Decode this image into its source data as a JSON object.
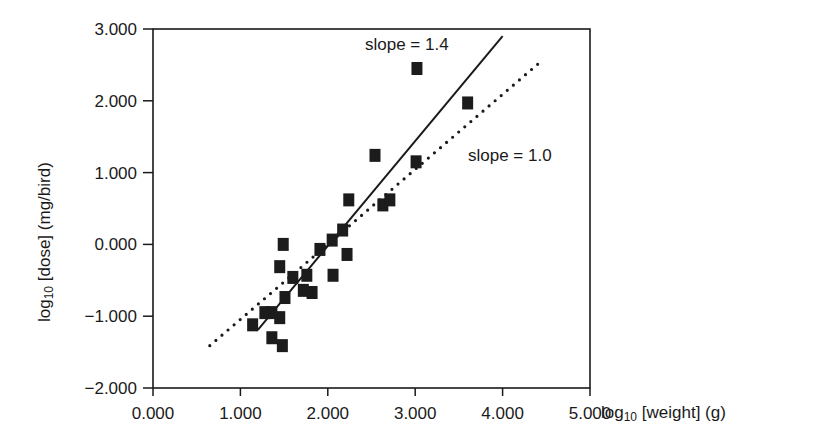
{
  "chart_data": {
    "type": "scatter",
    "title": "",
    "xlabel": "log10 [weight] (g)",
    "ylabel": "log10 [dose] (mg/bird)",
    "xlim": [
      0,
      5
    ],
    "ylim": [
      -2,
      3
    ],
    "x_ticks": [
      "0.000",
      "1.000",
      "2.000",
      "3.000",
      "4.000",
      "5.000"
    ],
    "y_ticks": [
      "-2.000",
      "-1.000",
      "0.000",
      "1.000",
      "2.000",
      "3.000"
    ],
    "grid": false,
    "legend": null,
    "series": [
      {
        "name": "observations",
        "marker": "square",
        "points": [
          [
            3.02,
            2.45
          ],
          [
            3.6,
            1.97
          ],
          [
            2.54,
            1.24
          ],
          [
            3.01,
            1.15
          ],
          [
            2.24,
            0.62
          ],
          [
            2.63,
            0.55
          ],
          [
            2.71,
            0.62
          ],
          [
            2.17,
            0.2
          ],
          [
            2.05,
            0.06
          ],
          [
            1.91,
            -0.07
          ],
          [
            2.22,
            -0.14
          ],
          [
            2.06,
            -0.43
          ],
          [
            1.49,
            0.0
          ],
          [
            1.45,
            -0.31
          ],
          [
            1.6,
            -0.46
          ],
          [
            1.76,
            -0.43
          ],
          [
            1.72,
            -0.64
          ],
          [
            1.82,
            -0.67
          ],
          [
            1.51,
            -0.74
          ],
          [
            1.28,
            -0.95
          ],
          [
            1.36,
            -0.95
          ],
          [
            1.45,
            -1.02
          ],
          [
            1.14,
            -1.12
          ],
          [
            1.36,
            -1.3
          ],
          [
            1.48,
            -1.41
          ]
        ]
      }
    ],
    "lines": [
      {
        "name": "slope = 1.4",
        "style": "solid",
        "from": [
          1.2,
          -1.19
        ],
        "to": [
          4.0,
          2.9
        ]
      },
      {
        "name": "slope = 1.0",
        "style": "dotted",
        "from": [
          0.65,
          -1.41
        ],
        "to": [
          4.45,
          2.56
        ]
      }
    ],
    "annotations": [
      {
        "text": "slope = 1.4",
        "x": 365,
        "y": 50
      },
      {
        "text": "slope = 1.0",
        "x": 468,
        "y": 160
      }
    ]
  },
  "labels": {
    "xlabel_main": "log",
    "xlabel_sub": "10",
    "xlabel_rest": " [weight] (g)",
    "ylabel_main": "log",
    "ylabel_sub": "10",
    "ylabel_rest": " [dose] (mg/bird)",
    "annot1": "slope = 1.4",
    "annot2": "slope = 1.0"
  }
}
